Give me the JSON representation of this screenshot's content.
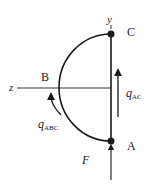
{
  "diagram": {
    "points": {
      "A": "A",
      "B": "B",
      "C": "C"
    },
    "axes": {
      "y": "y",
      "z": "z"
    },
    "force": "F",
    "flows": {
      "q_ac": {
        "symbol": "q",
        "subscript": "AC"
      },
      "q_abc": {
        "symbol": "q",
        "subscript": "ABC"
      }
    },
    "colors": {
      "stroke": "#1a1a1a",
      "background": "#ffffff"
    }
  }
}
